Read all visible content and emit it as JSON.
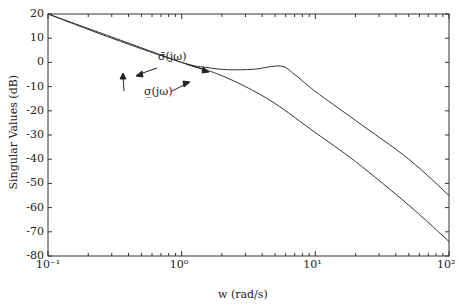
{
  "chart_data": {
    "type": "line",
    "title": "",
    "xlabel": "w (rad/s)",
    "ylabel": "Singular Values (dB)",
    "xscale": "log",
    "xlim": [
      0.1,
      100
    ],
    "ylim": [
      -80,
      20
    ],
    "xticks": [
      "10^-1",
      "10^0",
      "10^1",
      "10^2"
    ],
    "yticks": [
      20,
      10,
      0,
      -10,
      -20,
      -30,
      -40,
      -50,
      -60,
      -70,
      -80
    ],
    "grid": false,
    "series": [
      {
        "name": "σ̄(jω)",
        "x": [
          0.1,
          0.3,
          1,
          1.5,
          2.2,
          3.5,
          5.5,
          7,
          10,
          20,
          50,
          100
        ],
        "y": [
          20,
          10,
          0,
          -2,
          -3,
          -2.8,
          -1.5,
          -5,
          -12,
          -24,
          -40,
          -55
        ]
      },
      {
        "name": "σ̲(jω)",
        "x": [
          0.1,
          0.3,
          1,
          1.5,
          2,
          3,
          5,
          10,
          20,
          50,
          100
        ],
        "y": [
          20,
          10.5,
          0,
          -3,
          -5.5,
          -10,
          -17,
          -29,
          -41,
          -59,
          -74
        ]
      }
    ],
    "annotations": [
      "σ̄(jω)",
      "σ̲(jω)"
    ]
  },
  "labels": {
    "xlabel": "w (rad/s)",
    "ylabel": "Singular Values (dB)",
    "sigma_max": "σ̄(jω)",
    "sigma_min": "σ̲(jω)",
    "yticks": [
      "20",
      "10",
      "0",
      "-10",
      "-20",
      "-30",
      "-40",
      "-50",
      "-60",
      "-70",
      "-80"
    ],
    "xticks": [
      "10⁻¹",
      "10⁰",
      "10¹",
      "10²"
    ]
  }
}
